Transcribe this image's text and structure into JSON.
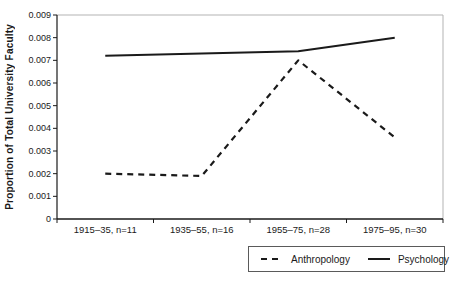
{
  "chart_data": {
    "type": "line",
    "title": "",
    "xlabel": "",
    "ylabel": "Proportion of Total University Faculty",
    "ylim": [
      0,
      0.009
    ],
    "ytick_interval": 0.001,
    "ytick_labels": [
      "0",
      "0.001",
      "0.002",
      "0.003",
      "0.004",
      "0.005",
      "0.006",
      "0.007",
      "0.008",
      "0.009"
    ],
    "categories": [
      "1915–35, n=11",
      "1935–55, n=16",
      "1955–75, n=28",
      "1975–95, n=30"
    ],
    "series": [
      {
        "name": "Anthropology",
        "style": "dashed",
        "color": "#1a1a1a",
        "values": [
          0.002,
          0.0019,
          0.007,
          0.0036
        ]
      },
      {
        "name": "Psychology",
        "style": "solid",
        "color": "#1a1a1a",
        "values": [
          0.0072,
          0.0073,
          0.0074,
          0.008
        ]
      }
    ],
    "grid": false,
    "legend_position": "bottom-right",
    "axis_color": "#1a1a1a",
    "frame_color": "#b3b3b3",
    "background_color": "#ffffff"
  }
}
